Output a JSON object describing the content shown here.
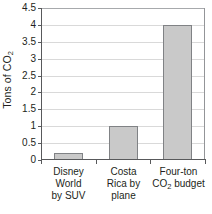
{
  "chart_data": {
    "type": "bar",
    "title": "",
    "xlabel": "",
    "ylabel": "Tons of CO2",
    "ylabel_parts": {
      "prefix": "Tons of CO",
      "subscript": "2"
    },
    "categories": [
      "Disney World by SUV",
      "Costa Rica by plane",
      "Four-ton CO2 budget"
    ],
    "category_lines": [
      [
        "Disney",
        "World",
        "by SUV"
      ],
      [
        "Costa",
        "Rica by",
        "plane"
      ],
      [
        "Four-ton",
        "CO2 budget"
      ]
    ],
    "values": [
      0.22,
      1.0,
      4.0
    ],
    "ylim": [
      0,
      4.5
    ],
    "ytick_labels": [
      "0",
      "0.5",
      "1",
      "1.5",
      "2",
      "2.5",
      "3",
      "3.5",
      "4",
      "4.5"
    ],
    "ytick_values": [
      0,
      0.5,
      1,
      1.5,
      2,
      2.5,
      3,
      3.5,
      4,
      4.5
    ],
    "grid": true,
    "legend": "none",
    "colors": {
      "bar_fill": "#c9c9c9",
      "bar_border": "#808285",
      "gridline": "#d9d9d9",
      "axis": "#58595b",
      "text": "#231f20",
      "background": "#ffffff"
    }
  }
}
